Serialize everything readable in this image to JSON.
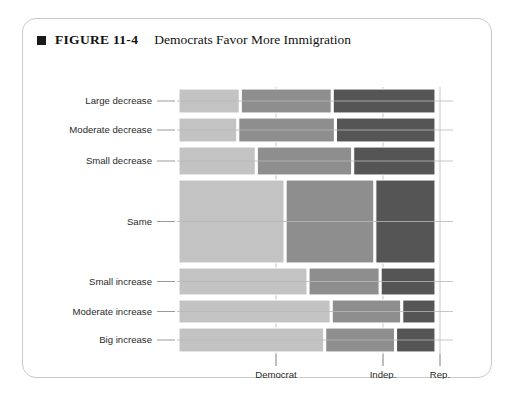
{
  "figure": {
    "bullet_icon": "black-square-bullet",
    "number_label": "FIGURE 11-4",
    "title": "Democrats Favor More Immigration"
  },
  "chart_data": {
    "type": "heatmap",
    "title": "Democrats Favor More Immigration",
    "subtitle": "",
    "xlabel": "",
    "ylabel": "",
    "grid": true,
    "legend_position": "none",
    "categories": [
      "Large decrease",
      "Moderate decrease",
      "Small decrease",
      "Same",
      "Small increase",
      "Moderate increase",
      "Big increase"
    ],
    "x": [
      "Democrat",
      "Indep.",
      "Rep."
    ],
    "row_heights": [
      24,
      24,
      28,
      83,
      27,
      23,
      24
    ],
    "series": [
      {
        "name": "Democrat",
        "color": "#c3c3c3",
        "values": [
          63,
          60,
          78,
          105,
          128,
          152,
          145
        ]
      },
      {
        "name": "Indep.",
        "color": "#8e8e8e",
        "values": [
          93,
          98,
          96,
          88,
          71,
          70,
          70
        ]
      },
      {
        "name": "Rep.",
        "color": "#555555",
        "values": [
          105,
          101,
          83,
          60,
          55,
          34,
          40
        ]
      }
    ],
    "tick_positions": [
      "Democrat",
      "Indep.",
      "Rep."
    ]
  },
  "axis": {
    "column_labels": [
      "Democrat",
      "Indep.",
      "Rep."
    ],
    "row_labels": [
      "Large decrease",
      "Moderate decrease",
      "Small decrease",
      "Same",
      "Small increase",
      "Moderate increase",
      "Big increase"
    ]
  },
  "colors": {
    "democrat": "#c3c3c3",
    "independent": "#8e8e8e",
    "republican": "#555555",
    "card_border": "#c9c9c9",
    "grid": "#b8b8b8",
    "text": "#2b2b2b",
    "background": "#ffffff"
  }
}
